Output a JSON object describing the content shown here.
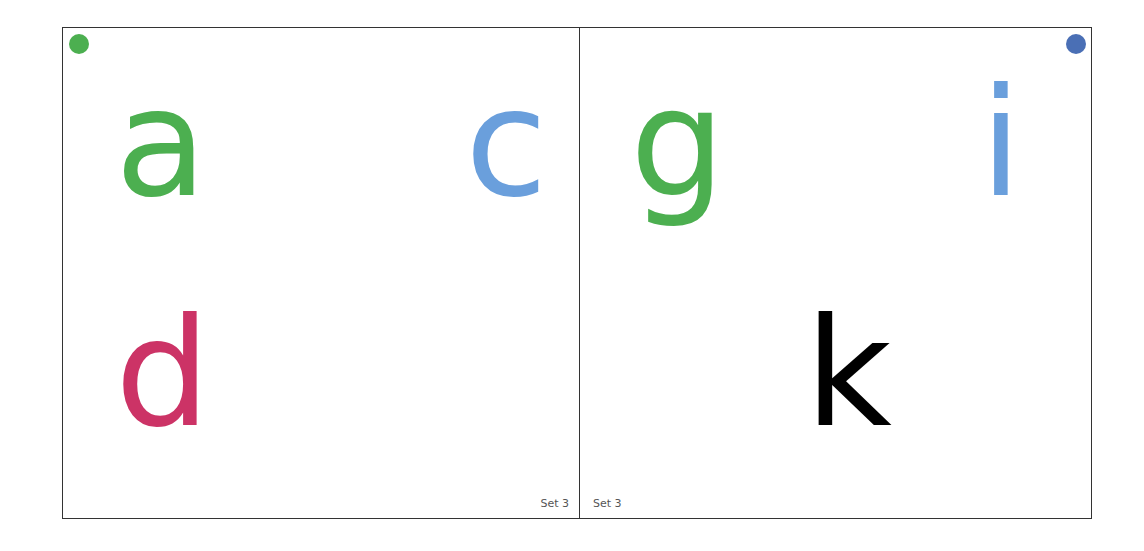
{
  "cards": [
    {
      "dot_color": "#4caf50",
      "letters": [
        {
          "char": "a",
          "color": "#4caf50"
        },
        {
          "char": "c",
          "color": "#6a9fdc"
        },
        {
          "char": "d",
          "color": "#cc3366"
        }
      ],
      "set_label": "Set 3"
    },
    {
      "dot_color": "#4a6fb5",
      "letters": [
        {
          "char": "g",
          "color": "#4caf50"
        },
        {
          "char": "i",
          "color": "#6a9fdc"
        },
        {
          "char": "k",
          "color": "#000000"
        }
      ],
      "set_label": "Set 3"
    }
  ]
}
